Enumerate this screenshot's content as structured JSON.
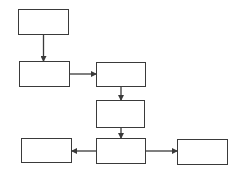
{
  "diagram": {
    "type": "flowchart",
    "colors": {
      "stroke": "#3a3a3a",
      "fill": "#ffffff",
      "background": "#ffffff"
    },
    "nodes": [
      {
        "id": "n1",
        "label": "",
        "x": 18,
        "y": 9,
        "w": 51,
        "h": 26
      },
      {
        "id": "n2",
        "label": "",
        "x": 19,
        "y": 61,
        "w": 51,
        "h": 26
      },
      {
        "id": "n3",
        "label": "",
        "x": 96,
        "y": 62,
        "w": 50,
        "h": 25
      },
      {
        "id": "n4",
        "label": "",
        "x": 96,
        "y": 100,
        "w": 49,
        "h": 28
      },
      {
        "id": "n5",
        "label": "",
        "x": 96,
        "y": 138,
        "w": 50,
        "h": 26
      },
      {
        "id": "n6",
        "label": "",
        "x": 21,
        "y": 138,
        "w": 51,
        "h": 25
      },
      {
        "id": "n7",
        "label": "",
        "x": 177,
        "y": 139,
        "w": 51,
        "h": 26
      }
    ],
    "edges": [
      {
        "from": "n1",
        "to": "n2",
        "direction": "down"
      },
      {
        "from": "n2",
        "to": "n3",
        "direction": "right"
      },
      {
        "from": "n3",
        "to": "n4",
        "direction": "down"
      },
      {
        "from": "n4",
        "to": "n5",
        "direction": "down"
      },
      {
        "from": "n5",
        "to": "n6",
        "direction": "left"
      },
      {
        "from": "n5",
        "to": "n7",
        "direction": "right"
      }
    ]
  }
}
